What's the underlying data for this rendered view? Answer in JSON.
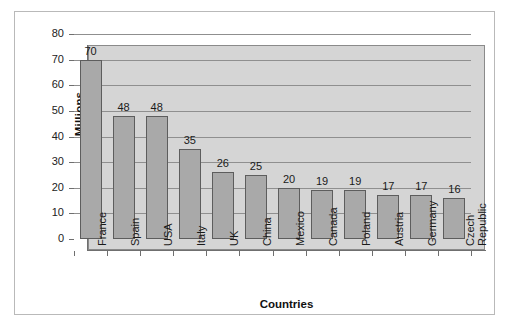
{
  "chart_data": {
    "type": "bar",
    "title": "",
    "xlabel": "Countries",
    "ylabel": "Millions",
    "categories": [
      "France",
      "Spain",
      "USA",
      "Italy",
      "UK",
      "China",
      "Mexico",
      "Canada",
      "Poland",
      "Austria",
      "Germany",
      "Czech Republic"
    ],
    "values": [
      70,
      48,
      48,
      35,
      26,
      25,
      20,
      19,
      19,
      17,
      17,
      16
    ],
    "data_labels": [
      "70",
      "48",
      "48",
      "35",
      "26",
      "25",
      "20",
      "19",
      "19",
      "17",
      "17",
      "16"
    ],
    "ylim": [
      0,
      80
    ],
    "ytick_values": [
      0,
      10,
      20,
      30,
      40,
      50,
      60,
      70,
      80
    ],
    "ytick_labels": [
      "0",
      "10",
      "20",
      "30",
      "40",
      "50",
      "60",
      "70",
      "80"
    ],
    "grid": "horizontal",
    "legend": "none",
    "series": [
      {
        "name": "Millions",
        "values": [
          70,
          48,
          48,
          35,
          26,
          25,
          20,
          19,
          19,
          17,
          17,
          16
        ]
      }
    ],
    "colors": {
      "bar_fill": "#a9a9a9",
      "bar_border": "#5d5d5d",
      "plot_background": "#d5d5d5",
      "gridline": "#8f8f8f",
      "axis": "#6f6f6f",
      "text": "#1a1a1a",
      "frame_border": "#b9b9b9",
      "page_background": "#ffffff"
    }
  }
}
